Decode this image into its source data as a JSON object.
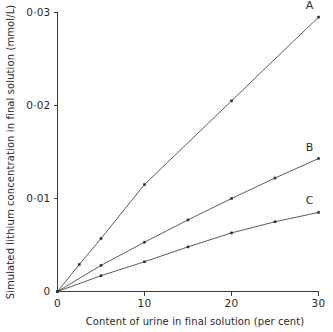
{
  "chart_data": {
    "type": "line",
    "title": "",
    "xlabel": "Content of urine in final solution (per cent)",
    "ylabel": "Simulated lithium concentration in final solution (mmol/L)",
    "xlim": [
      0,
      30
    ],
    "ylim": [
      0,
      0.03
    ],
    "xticks": [
      0,
      10,
      20,
      30
    ],
    "xticklabels": [
      "0",
      "10",
      "20",
      "30"
    ],
    "yticks": [
      0,
      0.01,
      0.02,
      0.03
    ],
    "yticklabels": [
      "0",
      "0·01",
      "0·02",
      "0·03"
    ],
    "grid": false,
    "legend_position": "inline-right",
    "series": [
      {
        "name": "A",
        "label": "A",
        "color": "#4a4a4a",
        "x": [
          0,
          2.5,
          5,
          10,
          20,
          30
        ],
        "values": [
          0,
          0.0029,
          0.0057,
          0.0115,
          0.0205,
          0.0295
        ]
      },
      {
        "name": "B",
        "label": "B",
        "color": "#4a4a4a",
        "x": [
          0,
          5,
          10,
          15,
          20,
          25,
          30
        ],
        "values": [
          0,
          0.0028,
          0.0053,
          0.0077,
          0.01,
          0.0122,
          0.0143
        ]
      },
      {
        "name": "C",
        "label": "C",
        "color": "#4a4a4a",
        "x": [
          0,
          5,
          10,
          15,
          20,
          25,
          30
        ],
        "values": [
          0,
          0.0017,
          0.0032,
          0.0048,
          0.0063,
          0.0075,
          0.0085
        ]
      }
    ]
  },
  "figure": {
    "axis_color": "#3a3a3a",
    "background": "#ffffff"
  }
}
